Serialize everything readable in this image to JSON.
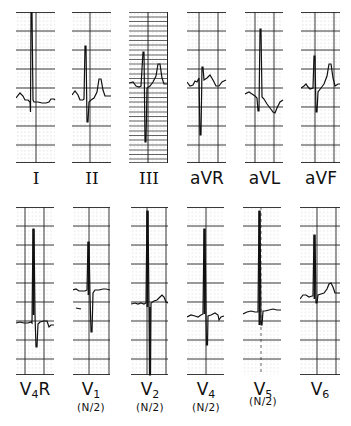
{
  "figure": {
    "grid_color": "#222222",
    "trace_color": "#111111"
  },
  "rows": [
    {
      "leads": [
        {
          "id": "I",
          "label": "I",
          "subscript": "",
          "suffix": "",
          "note": ""
        },
        {
          "id": "II",
          "label": "II",
          "subscript": "",
          "suffix": "",
          "note": ""
        },
        {
          "id": "III",
          "label": "III",
          "subscript": "",
          "suffix": "",
          "note": ""
        },
        {
          "id": "aVR",
          "label": "aVR",
          "subscript": "",
          "suffix": "",
          "note": ""
        },
        {
          "id": "aVL",
          "label": "aVL",
          "subscript": "",
          "suffix": "",
          "note": ""
        },
        {
          "id": "aVF",
          "label": "aVF",
          "subscript": "",
          "suffix": "",
          "note": ""
        }
      ]
    },
    {
      "leads": [
        {
          "id": "V4R",
          "label": "V",
          "subscript": "4",
          "suffix": "R",
          "note": ""
        },
        {
          "id": "V1",
          "label": "V",
          "subscript": "1",
          "suffix": "",
          "note": "(N/2)"
        },
        {
          "id": "V2",
          "label": "V",
          "subscript": "2",
          "suffix": "",
          "note": "(N/2)"
        },
        {
          "id": "V4",
          "label": "V",
          "subscript": "4",
          "suffix": "",
          "note": "(N/2)"
        },
        {
          "id": "V5",
          "label": "V",
          "subscript": "5",
          "suffix": "",
          "note": "(N/2)"
        },
        {
          "id": "V6",
          "label": "V",
          "subscript": "6",
          "suffix": "",
          "note": ""
        }
      ]
    }
  ]
}
